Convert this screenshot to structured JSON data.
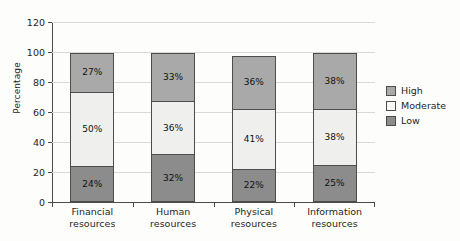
{
  "chart_data": {
    "type": "bar",
    "subtype": "stacked-vertical",
    "title": "",
    "xlabel": "",
    "ylabel": "Percentage",
    "ylim": [
      0,
      120
    ],
    "yticks": [
      0,
      20,
      40,
      60,
      80,
      100,
      120
    ],
    "ytick_labels": [
      "0",
      "20",
      "40",
      "60",
      "80",
      "100",
      "120"
    ],
    "grid": "horizontal",
    "legend_position": "right",
    "categories": [
      "Financial resources",
      "Human resources",
      "Physical resources",
      "Information resources"
    ],
    "category_lines": [
      [
        "Financial",
        "resources"
      ],
      [
        "Human",
        "resources"
      ],
      [
        "Physical",
        "resources"
      ],
      [
        "Information",
        "resources"
      ]
    ],
    "series": [
      {
        "name": "Low",
        "color": "#8c8c8c",
        "values": [
          24,
          32,
          22,
          25
        ],
        "labels": [
          "24%",
          "32%",
          "22%",
          "25%"
        ]
      },
      {
        "name": "Moderate",
        "color": "#efefed",
        "values": [
          50,
          36,
          41,
          38
        ],
        "labels": [
          "50%",
          "36%",
          "41%",
          "38%"
        ]
      },
      {
        "name": "High",
        "color": "#a9a9a9",
        "values": [
          27,
          33,
          36,
          38
        ],
        "labels": [
          "27%",
          "33%",
          "36%",
          "38%"
        ]
      }
    ],
    "stack_order_bottom_to_top": [
      "Low",
      "Moderate",
      "High"
    ],
    "totals": [
      101,
      101,
      99,
      101
    ]
  },
  "legend": {
    "items": [
      {
        "label": "High",
        "color": "#a9a9a9"
      },
      {
        "label": "Moderate",
        "color": "#f7f7f5"
      },
      {
        "label": "Low",
        "color": "#8c8c8c"
      }
    ]
  }
}
